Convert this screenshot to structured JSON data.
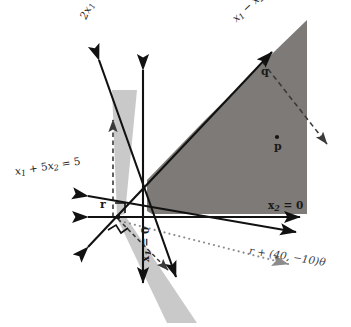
{
  "figure": {
    "background_color": "#ffffff",
    "width": 351,
    "height": 327,
    "colors": {
      "dark_region": "#7d7a77",
      "light_region": "#c9c9c9",
      "line": "#111111",
      "dashed": "#3a3a3a",
      "dotted": "#8c8c8c",
      "text": "#1a1a1a"
    }
  },
  "labels": {
    "constraint_2x1_x2": {
      "text": "2x1 + x2 = 6",
      "parts": {
        "a": "2",
        "x1": "x",
        "s1": "1",
        "plus": " + ",
        "x2": "x",
        "s2": "2",
        "eq": " = 6"
      },
      "rotation": -64,
      "x": 78,
      "y": 14
    },
    "constraint_x1_minus_x2": {
      "text": "x1 - x2 = -2",
      "parts": {
        "x1": "x",
        "s1": "1",
        "minus": " − ",
        "x2": "x",
        "s2": "2",
        "eq": " = −2"
      },
      "rotation": -43,
      "x": 232,
      "y": 14
    },
    "constraint_x1_5x2": {
      "text": "x1 + 5x2 = 5",
      "parts": {
        "x1": "x",
        "s1": "1",
        "plus": " + 5",
        "x2": "x",
        "s2": "2",
        "eq": " = 5"
      },
      "rotation": -9,
      "x": 12,
      "y": 168
    },
    "axis_x2_zero": {
      "text": "x2 = 0",
      "parts": {
        "x": "x",
        "s": "2",
        "eq": " = 0"
      },
      "x": 268,
      "y": 203
    },
    "axis_x1_zero": {
      "text": "x1 = 0",
      "parts": {
        "x": "x",
        "s": "1",
        "eq": " = 0"
      },
      "rotation": -90,
      "x": 143,
      "y": 260
    },
    "ray_label": {
      "text": "r + (40, -10)θ",
      "parts": {
        "r": "r",
        "mid": " + (40, −10)",
        "theta": "θ"
      },
      "rotation": 9,
      "x": 252,
      "y": 250
    },
    "point_p": {
      "text": "p",
      "x": 275,
      "y": 148
    },
    "point_q": {
      "text": "q",
      "x": 262,
      "y": 71
    },
    "point_r": {
      "text": "r",
      "x": 101,
      "y": 201
    }
  },
  "points": [
    {
      "name": "p",
      "cx": 277,
      "cy": 138,
      "label": "p"
    },
    {
      "name": "q",
      "cx": 265,
      "cy": 64,
      "label": "q"
    },
    {
      "name": "r",
      "cx": 118,
      "cy": 217,
      "label": "r"
    }
  ],
  "regions": [
    {
      "name": "feasible-region-dark",
      "fill": "#7d7a77",
      "points": "147,180 204,121 260,66 277,49 307,20 307,214 152,214 147,211"
    },
    {
      "name": "cone-upper-light",
      "fill": "#c9c9c9",
      "points": "113,89 136,89 124,216 118,217"
    },
    {
      "name": "cone-lower-light",
      "fill": "#c9c9c9",
      "points": "118,217 125,216 196,322 168,322"
    }
  ],
  "lines": [
    {
      "name": "line-2x1-x2-6",
      "style": "solid-double-arrow",
      "x1": 96,
      "y1": 54,
      "x2": 178,
      "y2": 281
    },
    {
      "name": "line-x1-5x2-5",
      "style": "solid-double-arrow",
      "x1": 85,
      "y1": 196,
      "x2": 299,
      "y2": 233
    },
    {
      "name": "line-x2-axis-horizontal",
      "style": "solid-double-arrow",
      "x1": 85,
      "y1": 217,
      "x2": 303,
      "y2": 217
    },
    {
      "name": "line-x1-axis-vertical",
      "style": "solid-double-arrow",
      "x1": 143,
      "y1": 66,
      "x2": 143,
      "y2": 286
    },
    {
      "name": "line-x1-minus-x2-neg2",
      "style": "solid-double-arrow",
      "x1": 85,
      "y1": 250,
      "x2": 274,
      "y2": 50
    },
    {
      "name": "normal-ray-from-r",
      "style": "dashed-arrow",
      "x1": 113,
      "y1": 217,
      "x2": 113,
      "y2": 116
    },
    {
      "name": "ray-from-q",
      "style": "dashed-arrow",
      "x1": 267,
      "y1": 68,
      "x2": 330,
      "y2": 147
    },
    {
      "name": "ray-r-plus-40-minus-10-theta",
      "style": "dotted-arrow",
      "x1": 120,
      "y1": 221,
      "x2": 292,
      "y2": 265
    },
    {
      "name": "dashed-cone-edge",
      "style": "dashed-plain",
      "x1": 118,
      "y1": 219,
      "x2": 170,
      "y2": 272
    }
  ]
}
